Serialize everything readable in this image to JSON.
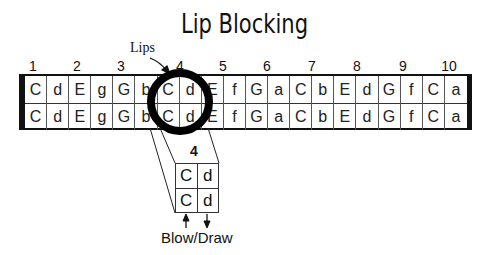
{
  "title": "Lip Blocking",
  "annotation": {
    "lips_label": "Lips"
  },
  "holes": [
    "1",
    "2",
    "3",
    "4",
    "5",
    "6",
    "7",
    "8",
    "9",
    "10"
  ],
  "harmonica": {
    "top_row": [
      "C",
      "d",
      "E",
      "g",
      "G",
      "b",
      "C",
      "d",
      "E",
      "f",
      "G",
      "a",
      "C",
      "b",
      "E",
      "d",
      "G",
      "f",
      "C",
      "a"
    ],
    "bottom_row": [
      "C",
      "d",
      "E",
      "g",
      "G",
      "b",
      "C",
      "d",
      "E",
      "f",
      "G",
      "a",
      "C",
      "b",
      "E",
      "d",
      "G",
      "f",
      "C",
      "a"
    ]
  },
  "zoom_detail": {
    "hole_label": "4",
    "top_row": [
      "C",
      "d"
    ],
    "bottom_row": [
      "C",
      "d"
    ],
    "legend": "Blow/Draw"
  },
  "highlight": {
    "hole": "4",
    "shape": "circle"
  }
}
